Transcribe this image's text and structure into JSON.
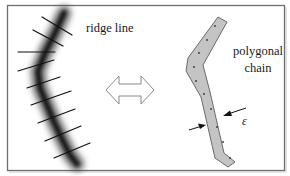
{
  "diagram": {
    "labels": {
      "ridge_line": "ridge line",
      "polygonal_line1": "polygonal",
      "polygonal_line2": "chain",
      "epsilon": "ε"
    },
    "colors": {
      "frame": "#6e6e6e",
      "ridge_core": "#111111",
      "chain_fill": "#c4c4c4",
      "chain_stroke": "#6a6a6a",
      "arrow_outline": "#8a8a8a",
      "text": "#1a1a1a"
    },
    "ridge_points": [
      [
        64,
        13
      ],
      [
        55,
        33
      ],
      [
        45,
        53
      ],
      [
        38,
        71
      ],
      [
        40,
        88
      ],
      [
        47,
        105
      ],
      [
        54,
        122
      ],
      [
        62,
        139
      ],
      [
        70,
        155
      ],
      [
        77,
        164
      ]
    ],
    "cross_ticks": [
      [
        [
          42,
          17
        ],
        [
          72,
          35
        ]
      ],
      [
        [
          33,
          30
        ],
        [
          63,
          46
        ]
      ],
      [
        [
          18,
          52
        ],
        [
          55,
          52
        ]
      ],
      [
        [
          18,
          71
        ],
        [
          54,
          60
        ]
      ],
      [
        [
          27,
          88
        ],
        [
          60,
          77
        ]
      ],
      [
        [
          31,
          105
        ],
        [
          71,
          91
        ]
      ],
      [
        [
          38,
          123
        ],
        [
          75,
          109
        ]
      ],
      [
        [
          45,
          141
        ],
        [
          81,
          126
        ]
      ],
      [
        [
          54,
          158
        ],
        [
          90,
          143
        ]
      ]
    ],
    "chain_dots": [
      [
        215,
        24
      ],
      [
        207,
        40
      ],
      [
        198,
        53
      ],
      [
        191,
        67
      ],
      [
        193,
        81
      ],
      [
        196,
        97
      ],
      [
        201,
        113
      ],
      [
        206,
        130
      ],
      [
        211,
        145
      ],
      [
        230,
        158
      ]
    ]
  }
}
